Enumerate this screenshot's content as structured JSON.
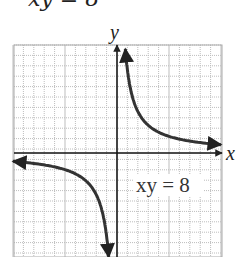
{
  "caption": {
    "top_cropped_text": "xy = 8"
  },
  "chart_data": {
    "type": "line",
    "title": "",
    "equation_label": "xy = 8",
    "xlabel": "x",
    "ylabel": "y",
    "grid": true,
    "grid_cells": {
      "columns": 20,
      "rows": 20
    },
    "xlim": [
      -10,
      10
    ],
    "ylim": [
      -10,
      10
    ],
    "legend": null,
    "series": [
      {
        "name": "xy = 8 (quadrant I branch)",
        "points": [
          [
            0.8,
            10
          ],
          [
            1,
            8
          ],
          [
            2,
            4
          ],
          [
            4,
            2
          ],
          [
            8,
            1
          ],
          [
            10,
            0.8
          ]
        ]
      },
      {
        "name": "xy = 8 (quadrant III branch)",
        "points": [
          [
            -10,
            -0.8
          ],
          [
            -8,
            -1
          ],
          [
            -4,
            -2
          ],
          [
            -2,
            -4
          ],
          [
            -1,
            -8
          ],
          [
            -0.8,
            -10
          ]
        ]
      }
    ],
    "colors": {
      "curve": "#333333",
      "axes": "#111111",
      "grid": "#b8b8b8"
    }
  }
}
